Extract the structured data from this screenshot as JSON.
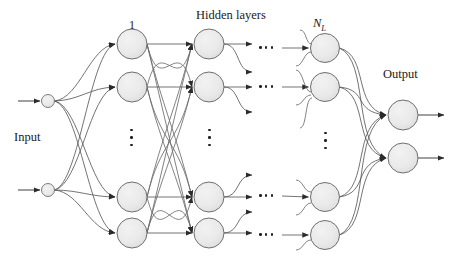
{
  "diagram": {
    "title": "Hidden layers",
    "input_label": "Input",
    "output_label": "Output",
    "first_layer_label": "1",
    "last_layer_label": "N",
    "last_layer_sub": "L",
    "colors": {
      "node_fill": "#e9e9e9",
      "node_stroke": "#6f6f6f",
      "edge": "#4a4a4a",
      "edge_light": "#8a8a8a",
      "text": "#1a1a1a",
      "background": "#ffffff"
    },
    "layers": [
      {
        "name": "input",
        "kind": "input",
        "x": 48,
        "radius": 6.5,
        "nodes": [
          {
            "y": 101
          },
          {
            "y": 190
          }
        ]
      },
      {
        "name": "hidden-1",
        "kind": "hidden",
        "x": 132,
        "radius": 15,
        "nodes": [
          {
            "y": 44
          },
          {
            "y": 87
          },
          {
            "y": 197
          },
          {
            "y": 233
          }
        ],
        "ellipsis_y": 137
      },
      {
        "name": "hidden-2",
        "kind": "hidden",
        "x": 209,
        "radius": 15,
        "nodes": [
          {
            "y": 44
          },
          {
            "y": 87
          },
          {
            "y": 197
          },
          {
            "y": 233
          }
        ],
        "ellipsis_y": 137
      },
      {
        "name": "hidden-NL",
        "kind": "hidden",
        "x": 325,
        "radius": 14.5,
        "nodes": [
          {
            "y": 48
          },
          {
            "y": 87
          },
          {
            "y": 197
          },
          {
            "y": 235
          }
        ],
        "ellipsis_y": 140
      },
      {
        "name": "output",
        "kind": "output",
        "x": 403,
        "radius": 15,
        "nodes": [
          {
            "y": 115
          },
          {
            "y": 158
          }
        ]
      }
    ],
    "horizontal_ellipses": [
      {
        "x": 266,
        "y": 48
      },
      {
        "x": 266,
        "y": 87
      },
      {
        "x": 266,
        "y": 196
      },
      {
        "x": 266,
        "y": 235
      }
    ],
    "labels": [
      {
        "id": "title",
        "text": "Hidden layers",
        "x": 196,
        "y": 9,
        "cls": "lbl-title"
      },
      {
        "id": "layer1",
        "text": "1",
        "x": 129,
        "y": 19,
        "cls": "lbl-layer"
      },
      {
        "id": "input",
        "text": "Input",
        "x": 14,
        "y": 131,
        "cls": "lbl-io"
      },
      {
        "id": "output",
        "text": "Output",
        "x": 383,
        "y": 68,
        "cls": "lbl-io"
      }
    ],
    "nl_label": {
      "x": 313,
      "y": 17
    }
  }
}
